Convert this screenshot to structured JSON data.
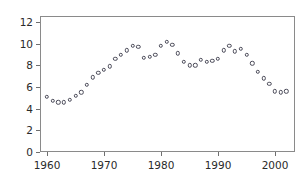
{
  "chart_data": {
    "type": "scatter",
    "title": "",
    "subtitle": "",
    "xlabel": "",
    "ylabel": "",
    "xlim": [
      1958.5,
      2002.8
    ],
    "ylim": [
      0,
      12.6
    ],
    "xticks": [
      1960,
      1970,
      1980,
      1990,
      2000
    ],
    "xticklabels": [
      "1960",
      "1970",
      "1980",
      "1990",
      "2000"
    ],
    "yticks": [
      0,
      2,
      4,
      6,
      8,
      10,
      12
    ],
    "yticklabels": [
      "0",
      "2",
      "4",
      "6",
      "8",
      "10",
      "12"
    ],
    "grid": false,
    "legend": null,
    "marker": "open-circle",
    "marker_color": "#4a4a58",
    "x": [
      1960,
      1961,
      1962,
      1963,
      1964,
      1965,
      1966,
      1967,
      1968,
      1969,
      1970,
      1971,
      1972,
      1973,
      1974,
      1975,
      1976,
      1977,
      1978,
      1979,
      1980,
      1981,
      1982,
      1983,
      1984,
      1985,
      1986,
      1987,
      1988,
      1989,
      1990,
      1991,
      1992,
      1993,
      1994,
      1995,
      1996,
      1997,
      1998,
      1999,
      2000,
      2001,
      2002
    ],
    "values": [
      5.1,
      4.7,
      4.6,
      4.6,
      4.8,
      5.2,
      5.5,
      6.2,
      6.9,
      7.3,
      7.6,
      7.9,
      8.6,
      9.0,
      9.4,
      9.8,
      9.7,
      8.7,
      8.8,
      9.0,
      9.8,
      10.2,
      9.9,
      9.1,
      8.3,
      8.0,
      8.0,
      8.5,
      8.3,
      8.4,
      8.6,
      9.4,
      9.8,
      9.3,
      9.5,
      9.0,
      8.2,
      7.4,
      6.8,
      6.3,
      5.6,
      5.5,
      5.6
    ]
  },
  "frame": {
    "border_color": "#8a8a8a",
    "background": "#ffffff"
  }
}
